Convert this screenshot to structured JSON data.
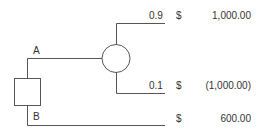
{
  "diagram": {
    "type": "decision-tree",
    "decision_node": {
      "shape": "square"
    },
    "branches": [
      {
        "label": "A",
        "leads_to": "chance-node"
      },
      {
        "label": "B",
        "currency": "$",
        "value": "600.00"
      }
    ],
    "chance_node": {
      "shape": "circle",
      "outcomes": [
        {
          "probability": "0.9",
          "currency": "$",
          "value": "1,000.00"
        },
        {
          "probability": "0.1",
          "currency": "$",
          "value": "(1,000.00)"
        }
      ]
    },
    "line_color": "#555555"
  }
}
